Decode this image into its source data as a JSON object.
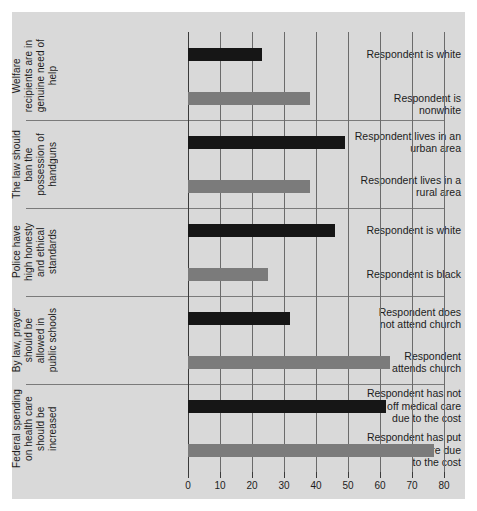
{
  "chart_data": {
    "type": "bar",
    "orientation": "horizontal",
    "title": "",
    "subtitle": "",
    "xlabel": "",
    "ylabel": "",
    "xlim": [
      0,
      80
    ],
    "xticks": [
      0,
      10,
      20,
      30,
      40,
      50,
      60,
      70,
      80
    ],
    "xtick_labels": [
      "0",
      "10",
      "20",
      "30",
      "40",
      "50",
      "60",
      "70",
      "80"
    ],
    "grid": true,
    "legend": "none",
    "colors": {
      "dark_bar": "#161616",
      "light_bar": "#7b7b7b",
      "background": "#d9d9d9",
      "gridline": "#6b6b6b",
      "axis": "#3a3a3a",
      "text": "#1c1c1c"
    },
    "groups": [
      {
        "group_label": "Welfare\nrecipients are in\ngenuine need of\nhelp",
        "bars": [
          {
            "category": "Respondent is white",
            "value": 23,
            "color": "dark"
          },
          {
            "category": "Respondent is nonwhite",
            "value": 38,
            "color": "light"
          }
        ]
      },
      {
        "group_label": "The law should\nban the\npossession of\nhandguns",
        "bars": [
          {
            "category": "Respondent lives in an\nurban area",
            "value": 49,
            "color": "dark"
          },
          {
            "category": "Respondent lives in a\nrural area",
            "value": 38,
            "color": "light"
          }
        ]
      },
      {
        "group_label": "Police have\nhigh honesty\nand ethical\nstandards",
        "bars": [
          {
            "category": "Respondent is white",
            "value": 46,
            "color": "dark"
          },
          {
            "category": "Respondent is black",
            "value": 25,
            "color": "light"
          }
        ]
      },
      {
        "group_label": "By law, prayer\nshould be\nallowed in\npublic schools",
        "bars": [
          {
            "category": "Respondent does\nnot attend church",
            "value": 32,
            "color": "dark"
          },
          {
            "category": "Respondent\nattends church",
            "value": 63,
            "color": "light"
          }
        ]
      },
      {
        "group_label": "Federal spending\non health care\nshould be\nincreased",
        "bars": [
          {
            "category": "Respondent has not\nput off medical care\ndue to the cost",
            "value": 62,
            "color": "dark"
          },
          {
            "category": "Respondent has put\noff medical care due\nto the cost",
            "value": 77,
            "color": "light"
          }
        ]
      }
    ]
  }
}
